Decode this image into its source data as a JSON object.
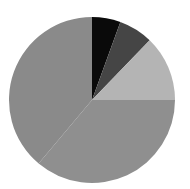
{
  "chart_data": {
    "type": "pie",
    "title": "",
    "subtitle": "",
    "xlabel": "",
    "ylabel": "",
    "grid": false,
    "legend": "none",
    "start_angle_deg": 0,
    "direction": "clockwise",
    "center": {
      "x": 92,
      "y": 100
    },
    "radius": 83,
    "labels": [
      "Segment 1",
      "Segment 2",
      "Segment 3",
      "Segment 4",
      "Segment 5"
    ],
    "values": [
      5.6,
      6.7,
      12.8,
      36.1,
      38.9
    ],
    "angles_deg": [
      20,
      24,
      46,
      130,
      140
    ],
    "colors": [
      "#0a0a0a",
      "#454545",
      "#b4b4b4",
      "#8f8f8f",
      "#8a8a8a"
    ],
    "slices": [
      {
        "label": "Segment 1",
        "value": 5.6,
        "angle_deg": 20,
        "start_deg": 0,
        "end_deg": 20,
        "color": "#0a0a0a",
        "name": "black-slice"
      },
      {
        "label": "Segment 2",
        "value": 6.7,
        "angle_deg": 24,
        "start_deg": 20,
        "end_deg": 44,
        "color": "#454545",
        "name": "dark-gray-slice"
      },
      {
        "label": "Segment 3",
        "value": 12.8,
        "angle_deg": 46,
        "start_deg": 44,
        "end_deg": 90,
        "color": "#b4b4b4",
        "name": "light-gray-slice"
      },
      {
        "label": "Segment 4",
        "value": 36.1,
        "angle_deg": 130,
        "start_deg": 90,
        "end_deg": 220,
        "color": "#8f8f8f",
        "name": "medium-gray-bottom-slice"
      },
      {
        "label": "Segment 5",
        "value": 38.9,
        "angle_deg": 140,
        "start_deg": 220,
        "end_deg": 360,
        "color": "#8a8a8a",
        "name": "medium-gray-left-slice"
      }
    ],
    "background_color": "#ffffff"
  }
}
